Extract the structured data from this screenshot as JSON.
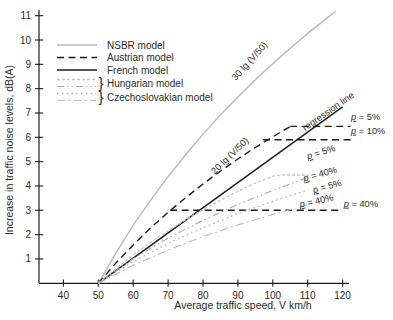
{
  "figure": {
    "width": 393,
    "height": 320,
    "background": "#ffffff",
    "axis_color": "#1c1c1c",
    "text_color": "#2b2b2b"
  },
  "chart_data": {
    "type": "line",
    "title": "",
    "xlabel": "Average traffic speed, V km/h",
    "ylabel": "Increase in traffic noise levels, dB(A)",
    "xticks": [
      40,
      50,
      60,
      70,
      80,
      90,
      100,
      110,
      120
    ],
    "yticks": [
      1,
      2,
      3,
      4,
      5,
      6,
      7,
      8,
      9,
      10,
      11
    ],
    "xlim": [
      37,
      123
    ],
    "ylim": [
      0,
      11.2
    ],
    "grid": false,
    "legend": {
      "position": "top-left",
      "items": [
        {
          "label": "NSBR model",
          "styles": [
            "nsbr"
          ],
          "braced": false
        },
        {
          "label": "Austrian model",
          "styles": [
            "austrian"
          ],
          "braced": false
        },
        {
          "label": "French model",
          "styles": [
            "french"
          ],
          "braced": false
        },
        {
          "label": "Hungarian model",
          "styles": [
            "hungarian_p5",
            "hungarian_p40"
          ],
          "braced": true
        },
        {
          "label": "Czechoslovakian model",
          "styles": [
            "czech_p5",
            "czech_p40"
          ],
          "braced": true
        }
      ]
    },
    "styles": {
      "nsbr": {
        "color": "#b9b9b9",
        "width": 1.4,
        "dash": ""
      },
      "austrian": {
        "color": "#1c1c1c",
        "width": 1.4,
        "dash": "7 4.5"
      },
      "french": {
        "color": "#1c1c1c",
        "width": 1.5,
        "dash": ""
      },
      "hungarian_p5": {
        "color": "#c6c6c6",
        "width": 1.3,
        "dash": "3 2"
      },
      "hungarian_p40": {
        "color": "#a9a9a9",
        "width": 1.1,
        "dash": "7 3 1.5 3 1.5 3"
      },
      "czech_p5": {
        "color": "#b3b3b3",
        "width": 1.3,
        "dash": "1.6 3.2"
      },
      "czech_p40": {
        "color": "#bbbbbb",
        "width": 1.1,
        "dash": "8 3.5 1.6 3.5"
      }
    },
    "series": [
      {
        "name": "NSBR model",
        "style": "nsbr",
        "formula": "30 lg (V/50)",
        "points": [
          [
            50,
            0
          ],
          [
            55,
            1.24
          ],
          [
            60,
            2.38
          ],
          [
            65,
            3.42
          ],
          [
            70,
            4.38
          ],
          [
            75,
            5.28
          ],
          [
            80,
            6.12
          ],
          [
            85,
            6.92
          ],
          [
            90,
            7.66
          ],
          [
            95,
            8.37
          ],
          [
            100,
            9.03
          ],
          [
            105,
            9.66
          ],
          [
            110,
            10.27
          ],
          [
            115,
            10.84
          ],
          [
            118,
            11.18
          ]
        ]
      },
      {
        "name": "Austrian model",
        "style": "austrian",
        "formula": "20 lg (V/50)",
        "points": [
          [
            50,
            0
          ],
          [
            55,
            0.83
          ],
          [
            60,
            1.58
          ],
          [
            65,
            2.28
          ],
          [
            70,
            2.92
          ],
          [
            75,
            3.52
          ],
          [
            80,
            4.08
          ],
          [
            85,
            4.61
          ],
          [
            90,
            5.11
          ],
          [
            95,
            5.58
          ],
          [
            100,
            6.02
          ],
          [
            105,
            6.44
          ]
        ],
        "caps": [
          {
            "label": "p = 5%",
            "value": 6.45,
            "from": 105.0,
            "to": 122.3
          },
          {
            "label": "p = 10%",
            "value": 5.9,
            "from": 97.2,
            "to": 122.3
          },
          {
            "label": "p = 40%",
            "value": 3.0,
            "from": 70.6,
            "to": 120.0
          }
        ]
      },
      {
        "name": "French model (regression line)",
        "style": "french",
        "points": [
          [
            50,
            0
          ],
          [
            120,
            7.25
          ]
        ]
      },
      {
        "name": "Hungarian model p = 5%",
        "style": "hungarian_p5",
        "points": [
          [
            50,
            0
          ],
          [
            55,
            0.61
          ],
          [
            60,
            1.17
          ],
          [
            65,
            1.69
          ],
          [
            70,
            2.16
          ],
          [
            75,
            2.61
          ],
          [
            80,
            3.02
          ],
          [
            85,
            3.41
          ],
          [
            90,
            3.78
          ],
          [
            95,
            4.12
          ],
          [
            100,
            4.4
          ],
          [
            103,
            4.45
          ],
          [
            110.5,
            4.45
          ]
        ]
      },
      {
        "name": "Hungarian model p = 40%",
        "style": "hungarian_p40",
        "points": [
          [
            50,
            0
          ],
          [
            60,
            1.01
          ],
          [
            70,
            1.86
          ],
          [
            80,
            2.59
          ],
          [
            90,
            3.24
          ],
          [
            100,
            3.82
          ],
          [
            110,
            4.35
          ]
        ]
      },
      {
        "name": "Czechoslovakian model p = 5%",
        "style": "czech_p5",
        "points": [
          [
            50,
            0
          ],
          [
            60,
            0.89
          ],
          [
            70,
            1.64
          ],
          [
            80,
            2.28
          ],
          [
            90,
            2.86
          ],
          [
            100,
            3.37
          ],
          [
            110,
            3.84
          ]
        ]
      },
      {
        "name": "Czechoslovakian model p = 40%",
        "style": "czech_p40",
        "points": [
          [
            50,
            0
          ],
          [
            60,
            0.74
          ],
          [
            70,
            1.37
          ],
          [
            80,
            1.92
          ],
          [
            90,
            2.4
          ],
          [
            100,
            2.83
          ],
          [
            110,
            3.22
          ]
        ]
      }
    ],
    "annotations": [
      {
        "text": "30 lg (V/50)",
        "v": 94.0,
        "db": 9.05,
        "rot": -48,
        "anchor": "middle",
        "underline_p": false
      },
      {
        "text": "20 lg (V/50)",
        "v": 88.3,
        "db": 5.15,
        "rot": -44,
        "anchor": "middle",
        "underline_p": false
      },
      {
        "text": "regression line",
        "v": 116.4,
        "db": 6.96,
        "rot": -35,
        "anchor": "middle",
        "underline_p": false
      },
      {
        "text": "p = 5%",
        "v": 122.4,
        "db": 6.72,
        "rot": 0,
        "anchor": "start",
        "underline_p": true
      },
      {
        "text": "p = 10%",
        "v": 122.4,
        "db": 6.15,
        "rot": 0,
        "anchor": "start",
        "underline_p": true
      },
      {
        "text": "p = 5%",
        "v": 114.1,
        "db": 5.27,
        "rot": -18,
        "anchor": "middle",
        "underline_p": true
      },
      {
        "text": "p = 40%",
        "v": 113.8,
        "db": 4.37,
        "rot": -15,
        "anchor": "middle",
        "underline_p": true
      },
      {
        "text": "p = 5%",
        "v": 115.8,
        "db": 3.86,
        "rot": -15,
        "anchor": "middle",
        "underline_p": true
      },
      {
        "text": "p = 40%",
        "v": 112.7,
        "db": 3.26,
        "rot": -12,
        "anchor": "middle",
        "underline_p": true
      },
      {
        "text": "p = 40%",
        "v": 120.3,
        "db": 3.15,
        "rot": 0,
        "anchor": "start",
        "underline_p": true
      }
    ]
  }
}
